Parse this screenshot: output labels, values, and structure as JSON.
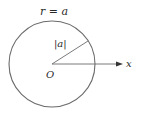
{
  "diagram": {
    "circle_label": "r = a",
    "radius_label": "|a|",
    "origin_label": "O",
    "axis_label": "x",
    "circle": {
      "cx": 52,
      "cy": 64,
      "r": 43
    },
    "colors": {
      "stroke": "#6b6b6b",
      "text": "#2a2a2a",
      "background": "#ffffff"
    }
  }
}
